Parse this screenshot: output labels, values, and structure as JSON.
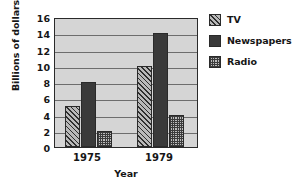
{
  "chart_data": {
    "type": "bar",
    "title": "",
    "xlabel": "Year",
    "ylabel": "Billions of dollars",
    "categories": [
      "1975",
      "1979"
    ],
    "series": [
      {
        "name": "TV",
        "values": [
          5,
          10
        ],
        "pattern": "diagonal-hatch",
        "color": "#b9b9b9"
      },
      {
        "name": "Newspapers",
        "values": [
          8,
          14
        ],
        "pattern": "solid",
        "color": "#3a3a3a"
      },
      {
        "name": "Radio",
        "values": [
          2,
          4
        ],
        "pattern": "dotted-grid",
        "color": "#bdbdbd"
      }
    ],
    "ylim": [
      0,
      16
    ],
    "ytick_step": 2,
    "yticks": [
      "16",
      "14",
      "12",
      "10",
      "8",
      "6",
      "4",
      "2",
      "0"
    ],
    "grid": true,
    "legend_position": "right",
    "plot_background": "#d5d5d5",
    "axis_color": "#2a2a2a"
  }
}
